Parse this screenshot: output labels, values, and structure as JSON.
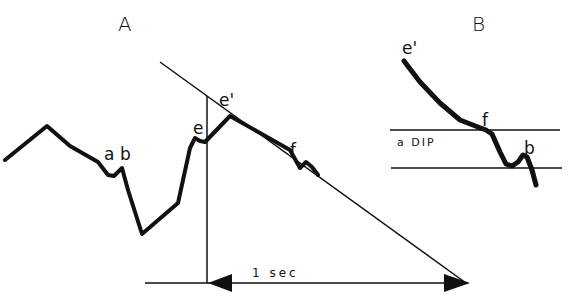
{
  "panels": {
    "A": {
      "label": "A",
      "points": {
        "a": "a",
        "b": "b",
        "e": "e",
        "e_prime": "e'",
        "f": "f"
      },
      "time_scale": "1  sec"
    },
    "B": {
      "label": "B",
      "points": {
        "e_prime": "e'",
        "f": "f",
        "b": "b"
      },
      "band_label": "a DIP"
    }
  },
  "colors": {
    "stroke": "#111111",
    "background": "#ffffff"
  }
}
